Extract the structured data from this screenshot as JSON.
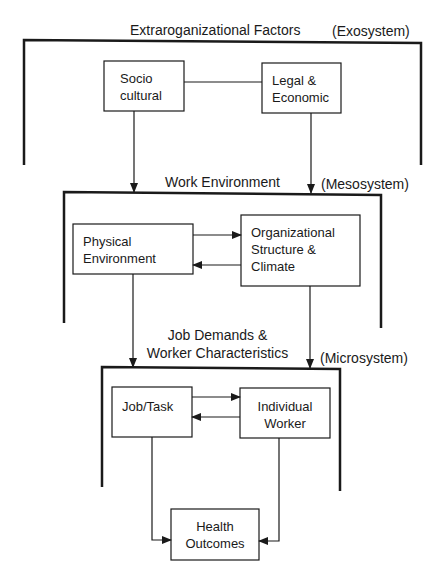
{
  "diagram": {
    "levels": [
      {
        "title": "Extraroganizational Factors",
        "system": "(Exosystem)",
        "nodes": [
          {
            "id": "socio",
            "lines": [
              "Socio",
              "cultural"
            ]
          },
          {
            "id": "legal",
            "lines": [
              "Legal &",
              "Economic"
            ]
          }
        ]
      },
      {
        "title": "Work Environment",
        "system": "(Mesosystem)",
        "nodes": [
          {
            "id": "physical",
            "lines": [
              "Physical",
              "Environment"
            ]
          },
          {
            "id": "org",
            "lines": [
              "Organizational",
              "Structure &",
              "Climate"
            ]
          }
        ]
      },
      {
        "title_lines": [
          "Job Demands &",
          "Worker Characteristics"
        ],
        "system": "(Microsystem)",
        "nodes": [
          {
            "id": "job",
            "lines": [
              "Job/Task"
            ]
          },
          {
            "id": "worker",
            "lines": [
              "Individual",
              "Worker"
            ]
          }
        ]
      }
    ],
    "outcome": {
      "id": "health",
      "lines": [
        "Health",
        "Outcomes"
      ]
    },
    "edges": [
      {
        "from": "socio",
        "to": "legal",
        "type": "line"
      },
      {
        "from": "socio",
        "to": "mesosystem",
        "type": "arrow"
      },
      {
        "from": "legal",
        "to": "mesosystem",
        "type": "arrow"
      },
      {
        "from": "physical",
        "to": "org",
        "type": "arrow"
      },
      {
        "from": "org",
        "to": "physical",
        "type": "arrow"
      },
      {
        "from": "physical",
        "to": "microsystem",
        "type": "arrow"
      },
      {
        "from": "org",
        "to": "microsystem",
        "type": "arrow"
      },
      {
        "from": "job",
        "to": "worker",
        "type": "arrow"
      },
      {
        "from": "worker",
        "to": "job",
        "type": "arrow"
      },
      {
        "from": "job",
        "to": "health",
        "type": "arrow"
      },
      {
        "from": "worker",
        "to": "health",
        "type": "arrow"
      }
    ]
  }
}
